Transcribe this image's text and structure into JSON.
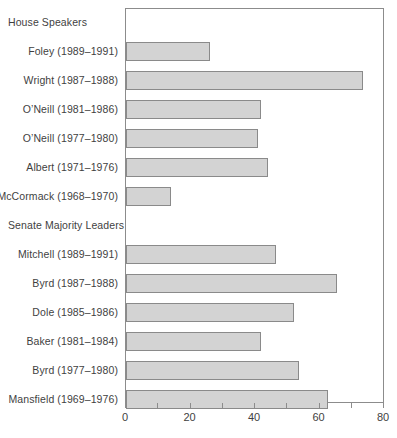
{
  "chart_data": {
    "type": "bar",
    "orientation": "horizontal",
    "title": "",
    "xlabel": "",
    "ylabel": "",
    "xlim": [
      0,
      80
    ],
    "xticks": [
      0,
      20,
      40,
      60,
      80
    ],
    "xtick_labels": [
      "0",
      "20",
      "40",
      "60",
      "80"
    ],
    "minor_tick_step": 10,
    "grid": false,
    "legend": false,
    "bar_color": "#d3d3d3",
    "bar_edge_color": "#8a8a8a",
    "axis_color": "#8c8c8c",
    "text_color": "#3f3f3f",
    "rows": [
      {
        "label": "House Speakers",
        "kind": "section",
        "value": null
      },
      {
        "label": "Foley (1989–1991)",
        "kind": "bar",
        "value": 26
      },
      {
        "label": "Wright (1987–1988)",
        "kind": "bar",
        "value": 73.5
      },
      {
        "label": "O’Neill (1981–1986)",
        "kind": "bar",
        "value": 42
      },
      {
        "label": "O’Neill (1977–1980)",
        "kind": "bar",
        "value": 41
      },
      {
        "label": "Albert (1971–1976)",
        "kind": "bar",
        "value": 44
      },
      {
        "label": "McCormack (1968–1970)",
        "kind": "bar",
        "value": 14
      },
      {
        "label": "Senate Majority Leaders",
        "kind": "section",
        "value": null
      },
      {
        "label": "Mitchell (1989–1991)",
        "kind": "bar",
        "value": 46.5
      },
      {
        "label": "Byrd (1987–1988)",
        "kind": "bar",
        "value": 65.5
      },
      {
        "label": "Dole (1985–1986)",
        "kind": "bar",
        "value": 52
      },
      {
        "label": "Baker (1981–1984)",
        "kind": "bar",
        "value": 42
      },
      {
        "label": "Byrd (1977–1980)",
        "kind": "bar",
        "value": 53.5
      },
      {
        "label": "Mansfield (1969–1976)",
        "kind": "bar",
        "value": 62.5
      }
    ],
    "categories": [
      "Foley (1989–1991)",
      "Wright (1987–1988)",
      "O’Neill (1981–1986)",
      "O’Neill (1977–1980)",
      "Albert (1971–1976)",
      "McCormack (1968–1970)",
      "Mitchell (1989–1991)",
      "Byrd (1987–1988)",
      "Dole (1985–1986)",
      "Baker (1981–1984)",
      "Byrd (1977–1980)",
      "Mansfield (1969–1976)"
    ],
    "values": [
      26,
      73.5,
      42,
      41,
      44,
      14,
      46.5,
      65.5,
      52,
      42,
      53.5,
      62.5
    ]
  }
}
